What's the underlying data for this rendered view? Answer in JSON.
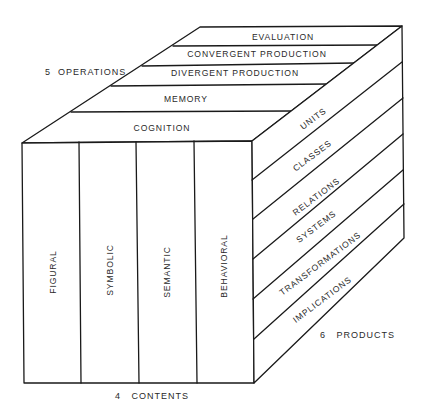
{
  "diagram": {
    "axes": {
      "operations": {
        "count": "5",
        "label": "OPERATIONS",
        "text": "5  OPERATIONS"
      },
      "contents": {
        "count": "4",
        "label": "CONTENTS",
        "text": "4   CONTENTS"
      },
      "products": {
        "count": "6",
        "label": "PRODUCTS",
        "text": "6   PRODUCTS"
      }
    },
    "operations": [
      {
        "label": "COGNITION"
      },
      {
        "label": "MEMORY"
      },
      {
        "label": "DIVERGENT PRODUCTION"
      },
      {
        "label": "CONVERGENT PRODUCTION"
      },
      {
        "label": "EVALUATION"
      }
    ],
    "contents": [
      {
        "label": "FIGURAL"
      },
      {
        "label": "SYMBOLIC"
      },
      {
        "label": "SEMANTIC"
      },
      {
        "label": "BEHAVIORAL"
      }
    ],
    "products": [
      {
        "label": "UNITS"
      },
      {
        "label": "CLASSES"
      },
      {
        "label": "RELATIONS"
      },
      {
        "label": "SYSTEMS"
      },
      {
        "label": "TRANSFORMATIONS"
      },
      {
        "label": "IMPLICATIONS"
      }
    ],
    "colors": {
      "line": "#1a1a1a",
      "text": "#2a2a2a",
      "background": "#ffffff"
    }
  }
}
